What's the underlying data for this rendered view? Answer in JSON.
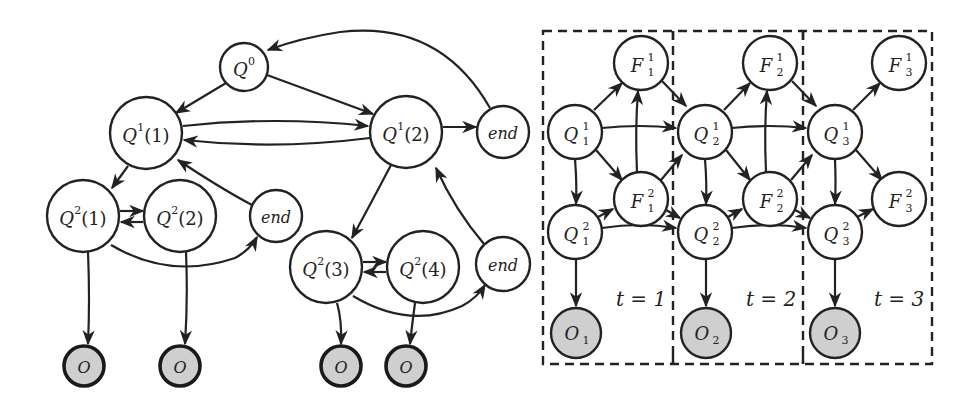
{
  "left_diagram": {
    "title": "Hierarchical HMM state topology",
    "nodes": [
      {
        "id": "q0",
        "label": "Q",
        "sup": "0",
        "arg": "",
        "x": 244,
        "y": 67,
        "r": 24,
        "type": "state"
      },
      {
        "id": "q1_1",
        "label": "Q",
        "sup": "1",
        "arg": "(1)",
        "x": 146,
        "y": 133,
        "r": 36,
        "type": "state"
      },
      {
        "id": "q1_2",
        "label": "Q",
        "sup": "1",
        "arg": "(2)",
        "x": 406,
        "y": 132,
        "r": 36,
        "type": "state"
      },
      {
        "id": "end_top",
        "label": "end",
        "x": 503,
        "y": 132,
        "r": 26,
        "type": "end"
      },
      {
        "id": "q2_1",
        "label": "Q",
        "sup": "2",
        "arg": "(1)",
        "x": 83,
        "y": 216,
        "r": 36,
        "type": "state"
      },
      {
        "id": "q2_2",
        "label": "Q",
        "sup": "2",
        "arg": "(2)",
        "x": 180,
        "y": 216,
        "r": 36,
        "type": "state"
      },
      {
        "id": "end_left",
        "label": "end",
        "x": 276,
        "y": 216,
        "r": 26,
        "type": "end"
      },
      {
        "id": "q2_3",
        "label": "Q",
        "sup": "2",
        "arg": "(3)",
        "x": 326,
        "y": 267,
        "r": 36,
        "type": "state"
      },
      {
        "id": "q2_4",
        "label": "Q",
        "sup": "2",
        "arg": "(4)",
        "x": 423,
        "y": 267,
        "r": 36,
        "type": "state"
      },
      {
        "id": "end_right",
        "label": "end",
        "x": 503,
        "y": 264,
        "r": 27,
        "type": "end"
      },
      {
        "id": "o1",
        "label": "O",
        "x": 84,
        "y": 366,
        "r": 20,
        "type": "observed"
      },
      {
        "id": "o2",
        "label": "O",
        "x": 180,
        "y": 366,
        "r": 20,
        "type": "observed"
      },
      {
        "id": "o3",
        "label": "O",
        "x": 341,
        "y": 366,
        "r": 20,
        "type": "observed"
      },
      {
        "id": "o4",
        "label": "O",
        "x": 406,
        "y": 366,
        "r": 20,
        "type": "observed"
      }
    ],
    "edges": [
      {
        "from": "q0",
        "to": "q1_1"
      },
      {
        "from": "q0",
        "to": "q1_2"
      },
      {
        "from": "q1_1",
        "to": "q1_2"
      },
      {
        "from": "q1_2",
        "to": "q1_1"
      },
      {
        "from": "q1_2",
        "to": "end_top"
      },
      {
        "from": "end_top",
        "to": "q0"
      },
      {
        "from": "q1_1",
        "to": "q2_1"
      },
      {
        "from": "q2_1",
        "to": "q2_2"
      },
      {
        "from": "q2_2",
        "to": "q2_1"
      },
      {
        "from": "q2_1",
        "to": "end_left"
      },
      {
        "from": "end_left",
        "to": "q1_1"
      },
      {
        "from": "q1_2",
        "to": "q2_3"
      },
      {
        "from": "q2_3",
        "to": "q2_4"
      },
      {
        "from": "q2_4",
        "to": "q2_3"
      },
      {
        "from": "q2_3",
        "to": "end_right"
      },
      {
        "from": "end_right",
        "to": "q1_2"
      },
      {
        "from": "q2_1",
        "to": "o1"
      },
      {
        "from": "q2_2",
        "to": "o2"
      },
      {
        "from": "q2_3",
        "to": "o3"
      },
      {
        "from": "q2_4",
        "to": "o4"
      }
    ]
  },
  "right_diagram": {
    "title": "Dynamic Bayesian network unrolled over time",
    "slices": [
      {
        "t_label": "t = 1",
        "index": "1"
      },
      {
        "t_label": "t = 2",
        "index": "2"
      },
      {
        "t_label": "t = 3",
        "index": "3"
      }
    ],
    "node_labels": {
      "F": "F",
      "Q": "Q",
      "O": "O",
      "level1": "1",
      "level2": "2"
    }
  }
}
